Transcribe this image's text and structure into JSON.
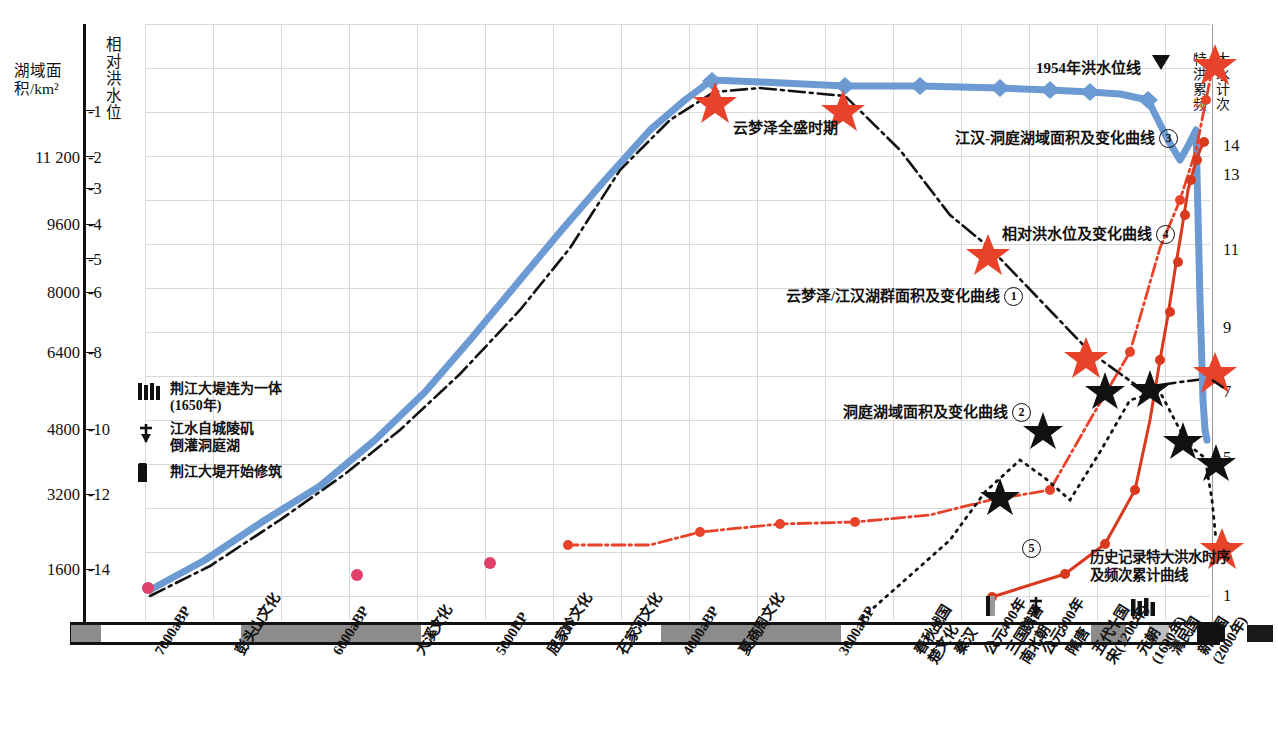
{
  "axes": {
    "left_area_title": "湖域面积/km²",
    "left_level_title": "相对洪水位",
    "right_title_col1": "特洪累频",
    "right_title_col2": "大水计次",
    "area_ticks": [
      "11 200",
      "9600",
      "8000",
      "6400",
      "4800",
      "3200",
      "1600"
    ],
    "level_ticks": [
      "-1",
      "-2",
      "-3",
      "-4",
      "-5",
      "-6",
      "-8",
      "-10",
      "-12",
      "-14"
    ],
    "freq_ticks": [
      "14",
      "13",
      "11",
      "9",
      "7",
      "5",
      "3",
      "1"
    ]
  },
  "annotations": {
    "flood_line_1954": "1954年洪水位线",
    "yunmeng_peak": "云梦泽全盛时期",
    "curve3": "江汉-洞庭湖域面积及变化曲线",
    "curve3_num": "3",
    "curve4": "相对洪水位及变化曲线",
    "curve4_num": "4",
    "curve1": "云梦泽/江汉湖群面积及变化曲线",
    "curve1_num": "1",
    "curve2": "洞庭湖域面积及变化曲线",
    "curve2_num": "2",
    "curve5_line1": "历史记录特大洪水时序",
    "curve5_line2": "及频次累计曲线",
    "curve5_num": "5"
  },
  "legend": [
    {
      "symbol": "levee-joined-icon",
      "label": "荆江大堤连为一体\n(1650年)"
    },
    {
      "symbol": "backflow-arrow-icon",
      "label": "江水自城陵矶\n倒灌洞庭湖"
    },
    {
      "symbol": "levee-start-icon",
      "label": "荆江大堤开始修筑"
    }
  ],
  "x_labels": [
    {
      "text": "7000aBP",
      "x": 152
    },
    {
      "text": "彭头山文化",
      "x": 233
    },
    {
      "text": "6000aBP",
      "x": 330
    },
    {
      "text": "大溪文化",
      "x": 413
    },
    {
      "text": "5000BP",
      "x": 493
    },
    {
      "text": "屈家岭文化",
      "x": 545
    },
    {
      "text": "石家河文化",
      "x": 615
    },
    {
      "text": "4000aBP",
      "x": 680
    },
    {
      "text": "夏商周文化",
      "x": 737
    },
    {
      "text": "3000aBP",
      "x": 836
    },
    {
      "text": "春秋战国\n楚文化",
      "x": 912
    },
    {
      "text": "秦汉",
      "x": 952
    },
    {
      "text": "公元400年",
      "x": 982
    },
    {
      "text": "三国魏晋\n南北朝",
      "x": 1004
    },
    {
      "text": "公元800年",
      "x": 1040
    },
    {
      "text": "隋唐",
      "x": 1064
    },
    {
      "text": "五代十国\n宋(1200年)",
      "x": 1090
    },
    {
      "text": "元朝\n(1600年)",
      "x": 1135
    },
    {
      "text": "清民国",
      "x": 1168
    },
    {
      "text": "新中国\n(2000年)",
      "x": 1196
    }
  ],
  "timeline_segments": [
    {
      "x": 0,
      "w": 30,
      "fill": "#8c8c8c"
    },
    {
      "x": 30,
      "w": 140,
      "fill": "#ffffff"
    },
    {
      "x": 170,
      "w": 180,
      "fill": "#8c8c8c"
    },
    {
      "x": 350,
      "w": 240,
      "fill": "#ffffff"
    },
    {
      "x": 590,
      "w": 180,
      "fill": "#8c8c8c"
    },
    {
      "x": 770,
      "w": 60,
      "fill": "#ffffff"
    },
    {
      "x": 830,
      "w": 190,
      "fill": "#ffffff"
    },
    {
      "x": 1020,
      "w": 35,
      "fill": "#8c8c8c"
    },
    {
      "x": 1055,
      "w": 23,
      "fill": "#ffffff"
    },
    {
      "x": 1078,
      "w": 20,
      "fill": "#c0c0c0"
    },
    {
      "x": 1098,
      "w": 28,
      "fill": "#ffffff"
    },
    {
      "x": 1126,
      "w": 28,
      "fill": "#111111"
    },
    {
      "x": 1154,
      "w": 22,
      "fill": "#ffffff"
    },
    {
      "x": 1176,
      "w": 26,
      "fill": "#1a1a1a"
    },
    {
      "x": 1202,
      "w": 24,
      "fill": "#ffffff"
    }
  ],
  "colors": {
    "blue": "#6b9bd2",
    "red": "#e8432a",
    "black": "#111111",
    "pink": "#e0416b",
    "grid": "#d9d9d9"
  },
  "chart_data": {
    "type": "line",
    "xlabel": "",
    "ylabel_left_area": "湖域面积/km²",
    "ylabel_left_level": "相对洪水位",
    "ylabel_right": "特大洪水累计频次",
    "grid": true,
    "legend_position": "in-plot-annotations",
    "x_categories": [
      "7000aBP",
      "彭头山文化",
      "6000aBP",
      "大溪文化",
      "5000BP",
      "屈家岭文化",
      "石家河文化",
      "4000aBP",
      "夏商周文化",
      "3000aBP",
      "春秋战国楚文化",
      "秦汉",
      "公元400年",
      "三国魏晋南北朝",
      "公元800年",
      "隋唐",
      "五代十国宋(1200年)",
      "元朝(1600年)",
      "清民国",
      "新中国(2000年)"
    ],
    "axis_ranges": {
      "area_km2": [
        1600,
        11200
      ],
      "relative_flood_level_m": [
        -14,
        -1
      ],
      "cumulative_extreme_flood_count": [
        1,
        14
      ]
    },
    "series": [
      {
        "name": "江汉-洞庭湖域面积及变化曲线",
        "marker": "3",
        "color": "#6b9bd2",
        "style": "solid-thick",
        "unit": "km²",
        "points": [
          {
            "x": 150,
            "area": 1300
          },
          {
            "x": 330,
            "area": 2900
          },
          {
            "x": 500,
            "area": 5100
          },
          {
            "x": 640,
            "area": 8200
          },
          {
            "x": 710,
            "area": 11900
          },
          {
            "x": 845,
            "area": 11800
          },
          {
            "x": 1050,
            "area": 11750
          },
          {
            "x": 1110,
            "area": 11700
          },
          {
            "x": 1145,
            "area": 11600
          },
          {
            "x": 1175,
            "area": 10900
          },
          {
            "x": 1195,
            "area": 11500
          },
          {
            "x": 1210,
            "area": 4900
          }
        ]
      },
      {
        "name": "云梦泽/江汉湖群面积及变化曲线",
        "marker": "1",
        "color": "#111111",
        "style": "dash-dot",
        "unit": "km²",
        "points": [
          {
            "x": 150,
            "area": 1100
          },
          {
            "x": 400,
            "area": 3400
          },
          {
            "x": 610,
            "area": 7600
          },
          {
            "x": 715,
            "area": 11850
          },
          {
            "x": 845,
            "area": 11700
          },
          {
            "x": 990,
            "area": 9200
          },
          {
            "x": 1100,
            "area": 6500
          },
          {
            "x": 1210,
            "area": 6700
          }
        ]
      },
      {
        "name": "洞庭湖域面积及变化曲线",
        "marker": "2",
        "color": "#111111",
        "style": "dot-dash-star",
        "unit": "km²",
        "points": [
          {
            "x": 860,
            "area": 900
          },
          {
            "x": 995,
            "area": 3300
          },
          {
            "x": 1040,
            "area": 4800
          },
          {
            "x": 1065,
            "area": 4400
          },
          {
            "x": 1100,
            "area": 6000
          },
          {
            "x": 1135,
            "area": 6900
          },
          {
            "x": 1165,
            "area": 5900
          },
          {
            "x": 1180,
            "area": 4700
          },
          {
            "x": 1205,
            "area": 4400
          },
          {
            "x": 1215,
            "area": 3600
          }
        ]
      },
      {
        "name": "相对洪水位及变化曲线",
        "marker": "4",
        "color": "#e8432a",
        "style": "dot-dash",
        "unit": "m",
        "points": [
          {
            "x": 560,
            "level": -13.4
          },
          {
            "x": 650,
            "level": -13.4
          },
          {
            "x": 700,
            "level": -13.1
          },
          {
            "x": 780,
            "level": -12.9
          },
          {
            "x": 855,
            "level": -12.9
          },
          {
            "x": 990,
            "level": -12.1
          },
          {
            "x": 1050,
            "level": -11.9
          },
          {
            "x": 1130,
            "level": -8.2
          },
          {
            "x": 1175,
            "level": -5.0
          },
          {
            "x": 1200,
            "level": -2.0
          },
          {
            "x": 1215,
            "level": -0.6
          }
        ]
      },
      {
        "name": "历史记录特大洪水时序及频次累计曲线",
        "marker": "5",
        "color": "#e8432a",
        "style": "solid-dot",
        "unit": "count",
        "points": [
          {
            "x": 992,
            "count": 1
          },
          {
            "x": 1065,
            "count": 1.4
          },
          {
            "x": 1105,
            "count": 2.4
          },
          {
            "x": 1135,
            "count": 3.8
          },
          {
            "x": 1162,
            "count": 6.2
          },
          {
            "x": 1180,
            "count": 8
          },
          {
            "x": 1188,
            "count": 9.3
          },
          {
            "x": 1194,
            "count": 10.6
          },
          {
            "x": 1199,
            "count": 11.8
          },
          {
            "x": 1203,
            "count": 13
          },
          {
            "x": 1206,
            "count": 14
          }
        ]
      },
      {
        "name": "早期孤立观测点",
        "marker": "dot",
        "color": "#e0416b",
        "style": "scatter",
        "points": [
          {
            "x": 150,
            "area": 1350
          },
          {
            "x": 360,
            "area": 1500
          },
          {
            "x": 490,
            "area": 1600
          }
        ]
      }
    ],
    "event_markers": [
      {
        "label": "云梦泽全盛时期",
        "type": "red-star",
        "x": 715
      },
      {
        "label": "1954年洪水位线",
        "type": "triangle-marker",
        "x": 1160
      }
    ]
  }
}
